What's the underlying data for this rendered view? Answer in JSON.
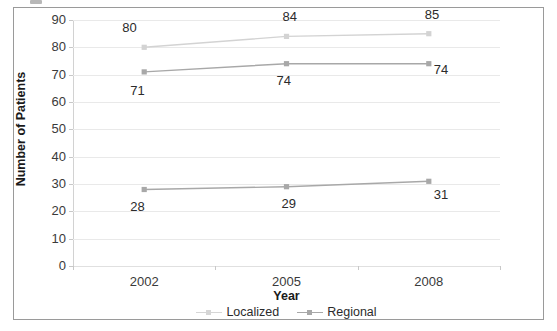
{
  "chart_data": {
    "type": "line",
    "title": "",
    "xlabel": "Year",
    "ylabel": "Number of Patients",
    "categories": [
      "2002",
      "2005",
      "2008"
    ],
    "x": [
      2002,
      2005,
      2008
    ],
    "ylim": [
      0,
      90
    ],
    "y_ticks": [
      0,
      10,
      20,
      30,
      40,
      50,
      60,
      70,
      80,
      90
    ],
    "y_tick_labels": [
      "0",
      "10",
      "20",
      "30",
      "40",
      "50",
      "60",
      "70",
      "80",
      "90"
    ],
    "grid": true,
    "grid_axis": "y",
    "legend_position": "bottom",
    "series": [
      {
        "name": "Localized",
        "values": [
          80,
          84,
          85
        ],
        "data_labels": [
          "80",
          "84",
          "85"
        ],
        "color": "#d3d3d3",
        "marker": "square",
        "in_legend": true
      },
      {
        "name": "Regional",
        "values": [
          71,
          74,
          74
        ],
        "data_labels": [
          "71",
          "74",
          "74"
        ],
        "color": "#a8a8a8",
        "marker": "square",
        "in_legend": true
      },
      {
        "name": "",
        "values": [
          28,
          29,
          31
        ],
        "data_labels": [
          "28",
          "29",
          "31"
        ],
        "color": "#a8a8a8",
        "marker": "square",
        "in_legend": false
      }
    ]
  },
  "axes": {
    "y_title": "Number of Patients",
    "x_title": "Year",
    "y_labels": [
      "90",
      "80",
      "70",
      "60",
      "50",
      "40",
      "30",
      "20",
      "10",
      "0"
    ],
    "x_labels": [
      "2002",
      "2005",
      "2008"
    ]
  },
  "legend": {
    "entries": [
      {
        "label": "Localized",
        "color": "#d6d6d6"
      },
      {
        "label": "Regional",
        "color": "#a8a8a8"
      }
    ]
  },
  "point_labels": {
    "localized": [
      "80",
      "84",
      "85"
    ],
    "regional": [
      "71",
      "74",
      "74"
    ],
    "third": [
      "28",
      "29",
      "31"
    ]
  },
  "colors": {
    "frame_border": "#9a9a9a",
    "gridline": "#e9e9e9",
    "axis_line": "#d2d2d2",
    "text": "#2b2b2b",
    "localized_line": "#d6d6d6",
    "regional_line": "#a8a8a8",
    "background": "#ffffff"
  }
}
